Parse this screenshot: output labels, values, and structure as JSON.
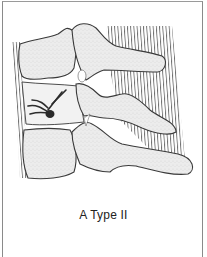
{
  "figure": {
    "caption": "A Type II",
    "colors": {
      "bone_fill": "#ebebeb",
      "outline": "#3a3a3a",
      "ligament_stripes": "#6a6a6a",
      "nerve": "#2c2c2c",
      "frame_border": "#8a8a8a",
      "background": "#ffffff"
    }
  }
}
